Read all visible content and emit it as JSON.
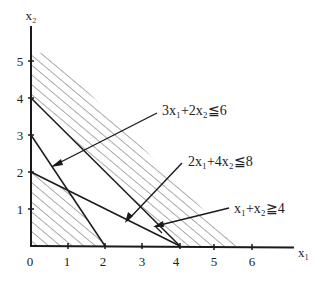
{
  "diagram": {
    "type": "linear-programming-feasible-region",
    "axes": {
      "x_label": "x₁",
      "y_label": "x₂",
      "x_ticks": [
        "0",
        "1",
        "2",
        "3",
        "4",
        "5",
        "6"
      ],
      "y_ticks": [
        "1",
        "2",
        "3",
        "4",
        "5"
      ]
    },
    "constraints": [
      {
        "id": "c1",
        "label": "3x₁+2x₂≦6",
        "line": {
          "x_intercept": 2,
          "y_intercept": 3
        },
        "shaded": "below"
      },
      {
        "id": "c2",
        "label": "2x₁+4x₂≦8",
        "line": {
          "x_intercept": 4,
          "y_intercept": 2
        },
        "shaded": "below"
      },
      {
        "id": "c3",
        "label": "x₁+x₂≧4",
        "line": {
          "x_intercept": 4,
          "y_intercept": 4
        },
        "shaded": "above"
      }
    ],
    "regions": [
      {
        "id": "feasible-region-lower",
        "vertices": [
          [
            0,
            0
          ],
          [
            2,
            0
          ],
          [
            1,
            1.5
          ],
          [
            0,
            2
          ]
        ],
        "hatched": true
      },
      {
        "id": "region-above-c3",
        "bounded_by": "x₁+x₂≧4",
        "hatched": true
      }
    ],
    "intersection_point": [
      1,
      1.5
    ],
    "colors": {
      "line": "#1a1a1a",
      "hatch": "#444444",
      "background": "#ffffff"
    }
  }
}
